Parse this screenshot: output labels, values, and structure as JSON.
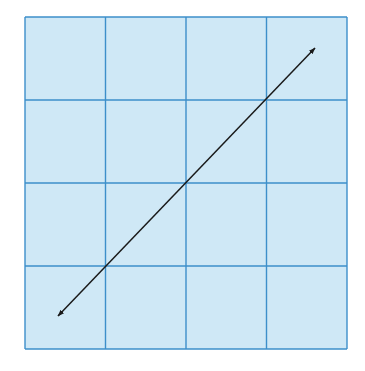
{
  "diagram": {
    "type": "coordinate-grid-with-line",
    "grid": {
      "rows": 4,
      "cols": 4,
      "x0": 25,
      "y0": 17,
      "x1": 347,
      "y1": 349,
      "fill": "#cfe8f6",
      "line_color": "#3d8fca"
    },
    "line": {
      "description": "Straight line with arrowheads on both ends, positive slope, passing through the grid center",
      "from": [
        58,
        316
      ],
      "to": [
        315,
        48
      ],
      "color": "#1a1a1a",
      "arrowheads": "both"
    }
  }
}
